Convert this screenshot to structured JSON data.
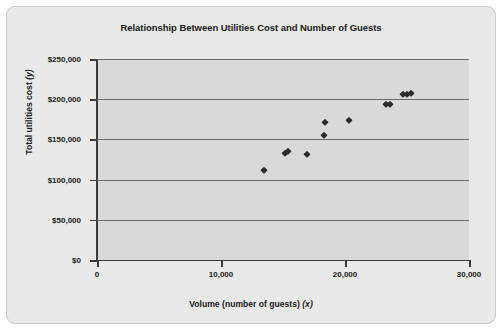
{
  "chart_data": {
    "type": "scatter",
    "title": "Relationship Between Utilities Cost and Number of Guests",
    "xlabel": "Volume (number of guests) (x)",
    "xlabel_text": "Volume (number of guests) ",
    "xlabel_var": "(x)",
    "ylabel": "Total utilities cost (y)",
    "ylabel_text": "Total utilities cost ",
    "ylabel_var": "(y)",
    "xlim": [
      0,
      30000
    ],
    "ylim": [
      0,
      250000
    ],
    "xticks": [
      0,
      10000,
      20000,
      30000
    ],
    "xtick_labels": [
      "0",
      "10,000",
      "20,000",
      "30,000"
    ],
    "yticks": [
      0,
      50000,
      100000,
      150000,
      200000,
      250000
    ],
    "ytick_labels": [
      "$0",
      "$50,000",
      "$100,000",
      "$150,000",
      "$200,000",
      "$250,000"
    ],
    "grid": true,
    "grid_axis": "y",
    "legend": null,
    "marker": "diamond",
    "marker_color": "#2b2b2b",
    "plot_background": "#d9d9d9",
    "figure_background": "#e9e9e9",
    "points": [
      {
        "x": 13500,
        "y": 112000
      },
      {
        "x": 15200,
        "y": 133000
      },
      {
        "x": 15400,
        "y": 136000
      },
      {
        "x": 16900,
        "y": 132000
      },
      {
        "x": 18300,
        "y": 155000
      },
      {
        "x": 18350,
        "y": 172000
      },
      {
        "x": 20300,
        "y": 174000
      },
      {
        "x": 23300,
        "y": 194000
      },
      {
        "x": 23600,
        "y": 194000
      },
      {
        "x": 24700,
        "y": 207000
      },
      {
        "x": 25000,
        "y": 207000
      },
      {
        "x": 25350,
        "y": 207500
      }
    ]
  }
}
